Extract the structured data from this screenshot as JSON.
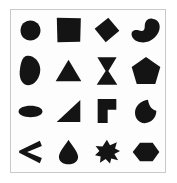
{
  "canvas": {
    "width": 177,
    "height": 183,
    "background_color": "#ffffff"
  },
  "card": {
    "border_color": "#c9c9c9",
    "background_color": "#fdfdfd"
  },
  "shape_palette": {
    "fill_color": "#141414"
  },
  "grid": {
    "rows": 4,
    "columns": 4,
    "cells": [
      {
        "row": 1,
        "column": 1,
        "icon": "circle-shape",
        "label": "circle"
      },
      {
        "row": 1,
        "column": 2,
        "icon": "square-shape",
        "label": "square"
      },
      {
        "row": 1,
        "column": 3,
        "icon": "diamond-shape",
        "label": "diamond"
      },
      {
        "row": 1,
        "column": 4,
        "icon": "bean-shape",
        "label": "bean"
      },
      {
        "row": 2,
        "column": 1,
        "icon": "leaf-blob-shape",
        "label": "leaf blob"
      },
      {
        "row": 2,
        "column": 2,
        "icon": "triangle-shape",
        "label": "triangle"
      },
      {
        "row": 2,
        "column": 3,
        "icon": "hourglass-shape",
        "label": "hourglass"
      },
      {
        "row": 2,
        "column": 4,
        "icon": "pentagon-shape",
        "label": "pentagon"
      },
      {
        "row": 3,
        "column": 1,
        "icon": "ellipse-shape",
        "label": "ellipse"
      },
      {
        "row": 3,
        "column": 2,
        "icon": "right-triangle-shape",
        "label": "right triangle"
      },
      {
        "row": 3,
        "column": 3,
        "icon": "l-bracket-shape",
        "label": "L bracket"
      },
      {
        "row": 3,
        "column": 4,
        "icon": "crescent-shape",
        "label": "crescent"
      },
      {
        "row": 4,
        "column": 1,
        "icon": "chevron-left-shape",
        "label": "chevron left"
      },
      {
        "row": 4,
        "column": 2,
        "icon": "teardrop-shape",
        "label": "teardrop"
      },
      {
        "row": 4,
        "column": 3,
        "icon": "spiky-star-shape",
        "label": "spiky star"
      },
      {
        "row": 4,
        "column": 4,
        "icon": "hexagon-shape",
        "label": "hexagon"
      }
    ]
  }
}
